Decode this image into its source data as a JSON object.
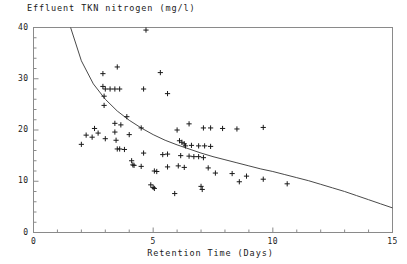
{
  "chart_data": {
    "type": "scatter",
    "title": "Effluent TKN nitrogen (mg/l)",
    "xlabel": "Retention Time (Days)",
    "ylabel": "",
    "xlim": [
      0,
      15
    ],
    "ylim": [
      0,
      40
    ],
    "grid": false,
    "legend": null,
    "x_ticks": [
      0,
      5,
      10,
      15
    ],
    "x_tick_labels": [
      "0",
      "5",
      "10",
      "15"
    ],
    "x_minor_tick_interval": 1,
    "y_ticks": [
      0,
      10,
      20,
      30,
      40
    ],
    "y_tick_labels": [
      "0",
      "10",
      "20",
      "30",
      "40"
    ],
    "y_minor_tick_interval": 2,
    "marker": "plus",
    "marker_color": "#1a1a1a",
    "series": [
      {
        "name": "observations",
        "type": "scatter",
        "points": [
          [
            2.9,
            31.0
          ],
          [
            3.5,
            32.3
          ],
          [
            4.7,
            39.5
          ],
          [
            5.3,
            31.2
          ],
          [
            2.9,
            28.5
          ],
          [
            3.0,
            28.0
          ],
          [
            3.2,
            28.0
          ],
          [
            3.4,
            28.0
          ],
          [
            3.6,
            28.0
          ],
          [
            2.95,
            26.6
          ],
          [
            4.6,
            28.0
          ],
          [
            5.6,
            27.1
          ],
          [
            2.95,
            24.8
          ],
          [
            3.9,
            22.6
          ],
          [
            3.4,
            21.3
          ],
          [
            3.65,
            21.0
          ],
          [
            3.4,
            19.6
          ],
          [
            4.0,
            19.1
          ],
          [
            4.5,
            20.4
          ],
          [
            3.45,
            18.0
          ],
          [
            3.5,
            16.3
          ],
          [
            3.6,
            16.3
          ],
          [
            3.8,
            16.2
          ],
          [
            2.55,
            20.3
          ],
          [
            2.7,
            19.4
          ],
          [
            2.2,
            19.0
          ],
          [
            2.45,
            18.6
          ],
          [
            3.0,
            18.3
          ],
          [
            4.1,
            14.0
          ],
          [
            4.15,
            13.2
          ],
          [
            4.2,
            13.1
          ],
          [
            4.5,
            12.9
          ],
          [
            5.05,
            12.0
          ],
          [
            5.15,
            11.9
          ],
          [
            4.9,
            9.3
          ],
          [
            5.0,
            8.8
          ],
          [
            5.05,
            8.6
          ],
          [
            6.1,
            17.9
          ],
          [
            6.2,
            17.6
          ],
          [
            6.3,
            17.3
          ],
          [
            6.35,
            16.9
          ],
          [
            6.0,
            20.0
          ],
          [
            6.5,
            21.2
          ],
          [
            7.1,
            20.4
          ],
          [
            7.4,
            20.4
          ],
          [
            7.9,
            20.3
          ],
          [
            8.5,
            20.2
          ],
          [
            9.6,
            20.5
          ],
          [
            6.6,
            17.0
          ],
          [
            6.9,
            16.9
          ],
          [
            7.15,
            16.9
          ],
          [
            7.4,
            16.8
          ],
          [
            6.5,
            14.9
          ],
          [
            6.7,
            14.8
          ],
          [
            6.9,
            14.8
          ],
          [
            7.1,
            14.6
          ],
          [
            6.05,
            13.0
          ],
          [
            5.6,
            12.8
          ],
          [
            6.3,
            12.7
          ],
          [
            7.3,
            12.6
          ],
          [
            7.0,
            9.0
          ],
          [
            7.05,
            8.4
          ],
          [
            5.9,
            7.6
          ],
          [
            7.6,
            11.6
          ],
          [
            8.3,
            11.5
          ],
          [
            8.9,
            11.0
          ],
          [
            8.6,
            9.9
          ],
          [
            9.6,
            10.4
          ],
          [
            10.6,
            9.5
          ],
          [
            2.0,
            17.2
          ],
          [
            5.4,
            15.2
          ],
          [
            4.6,
            15.5
          ],
          [
            5.6,
            15.3
          ],
          [
            6.15,
            15.0
          ]
        ]
      },
      {
        "name": "fitted-curve",
        "type": "line",
        "color": "#4a4a4a",
        "description": "decaying fitted curve from top-left to lower-right",
        "points": [
          [
            1.55,
            40.0
          ],
          [
            2.0,
            33.5
          ],
          [
            2.5,
            29.0
          ],
          [
            3.0,
            26.0
          ],
          [
            3.5,
            23.7
          ],
          [
            4.0,
            21.9
          ],
          [
            4.5,
            20.4
          ],
          [
            5.0,
            19.1
          ],
          [
            5.5,
            18.0
          ],
          [
            6.0,
            17.1
          ],
          [
            6.5,
            16.3
          ],
          [
            7.0,
            15.5
          ],
          [
            7.5,
            14.8
          ],
          [
            8.0,
            14.2
          ],
          [
            8.5,
            13.6
          ],
          [
            9.0,
            13.0
          ],
          [
            9.5,
            12.4
          ],
          [
            10.0,
            11.9
          ],
          [
            10.5,
            11.3
          ],
          [
            11.0,
            10.7
          ],
          [
            11.5,
            10.1
          ],
          [
            12.0,
            9.4
          ],
          [
            12.5,
            8.7
          ],
          [
            13.0,
            8.0
          ],
          [
            13.5,
            7.2
          ],
          [
            14.0,
            6.4
          ],
          [
            14.5,
            5.6
          ],
          [
            15.0,
            4.8
          ]
        ]
      }
    ]
  },
  "figure": {
    "background": "#ffffff",
    "axis_color": "#8a8a8a",
    "text_color": "#1a1a1a"
  }
}
